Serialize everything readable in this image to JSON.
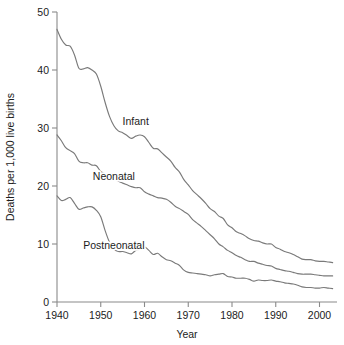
{
  "chart_data": {
    "type": "line",
    "title": "",
    "xlabel": "Year",
    "ylabel": "Deaths per 1,000 live births",
    "xlim": [
      1940,
      2004
    ],
    "ylim": [
      0,
      50
    ],
    "grid": false,
    "legend_position": "inline-labels",
    "xticks": [
      1940,
      1950,
      1960,
      1970,
      1980,
      1990,
      2000
    ],
    "xtick_labels": [
      "1940",
      "1950",
      "1960",
      "1970",
      "1980",
      "1990",
      "2000"
    ],
    "yticks": [
      0,
      10,
      20,
      30,
      40,
      50
    ],
    "ytick_labels": [
      "0",
      "10",
      "20",
      "30",
      "40",
      "50"
    ],
    "line_color": "#7a7a7a",
    "x": [
      1940,
      1941,
      1942,
      1943,
      1944,
      1945,
      1946,
      1947,
      1948,
      1949,
      1950,
      1951,
      1952,
      1953,
      1954,
      1955,
      1956,
      1957,
      1958,
      1959,
      1960,
      1961,
      1962,
      1963,
      1964,
      1965,
      1966,
      1967,
      1968,
      1969,
      1970,
      1971,
      1972,
      1973,
      1974,
      1975,
      1976,
      1977,
      1978,
      1979,
      1980,
      1981,
      1982,
      1983,
      1984,
      1985,
      1986,
      1987,
      1988,
      1989,
      1990,
      1991,
      1992,
      1993,
      1994,
      1995,
      1996,
      1997,
      1998,
      1999,
      2000,
      2001,
      2002,
      2003
    ],
    "series": [
      {
        "name": "Infant",
        "label": "Infant",
        "label_x": 1958,
        "label_y": 30.5,
        "values": [
          47.0,
          45.3,
          44.3,
          44.1,
          42.6,
          40.3,
          40.2,
          40.4,
          40.0,
          39.3,
          37.2,
          34.4,
          32.0,
          30.4,
          29.5,
          29.2,
          28.7,
          28.2,
          28.6,
          28.8,
          28.5,
          27.5,
          26.5,
          26.4,
          25.7,
          25.0,
          24.3,
          23.2,
          22.4,
          21.1,
          20.2,
          19.2,
          18.5,
          17.8,
          17.0,
          16.1,
          15.6,
          14.8,
          14.4,
          13.3,
          12.8,
          12.1,
          11.8,
          11.4,
          10.9,
          10.6,
          10.5,
          10.2,
          10.0,
          10.0,
          9.4,
          9.1,
          8.7,
          8.5,
          8.2,
          7.8,
          7.4,
          7.3,
          7.3,
          7.1,
          7.0,
          7.0,
          6.9,
          6.8
        ]
      },
      {
        "name": "Neonatal",
        "label": "Neonatal",
        "label_x": 1953,
        "label_y": 21.0,
        "values": [
          28.8,
          27.8,
          26.6,
          26.1,
          25.6,
          24.3,
          24.0,
          24.0,
          23.6,
          23.5,
          22.5,
          22.1,
          21.7,
          21.3,
          20.8,
          20.5,
          20.2,
          19.9,
          19.7,
          19.7,
          19.0,
          18.6,
          18.3,
          18.0,
          17.9,
          17.7,
          17.2,
          16.5,
          16.1,
          15.6,
          15.1,
          14.2,
          13.6,
          13.0,
          12.3,
          11.6,
          10.9,
          10.0,
          9.5,
          8.9,
          8.5,
          8.0,
          7.7,
          7.3,
          7.0,
          7.0,
          6.7,
          6.5,
          6.3,
          6.2,
          5.8,
          5.6,
          5.4,
          5.3,
          5.1,
          4.9,
          4.8,
          4.8,
          4.8,
          4.7,
          4.6,
          4.5,
          4.5,
          4.5
        ]
      },
      {
        "name": "Postneonatal",
        "label": "Postneonatal",
        "label_x": 1953,
        "label_y": 9.2,
        "values": [
          18.3,
          17.5,
          17.7,
          18.0,
          17.0,
          16.0,
          16.2,
          16.4,
          16.4,
          15.8,
          14.7,
          12.3,
          10.3,
          9.1,
          8.7,
          8.7,
          8.5,
          8.3,
          8.9,
          9.1,
          9.5,
          8.9,
          8.2,
          8.4,
          7.8,
          7.3,
          7.1,
          6.7,
          6.3,
          5.5,
          5.1,
          5.0,
          4.9,
          4.8,
          4.7,
          4.5,
          4.7,
          4.8,
          4.9,
          4.4,
          4.3,
          4.1,
          4.1,
          4.1,
          3.9,
          3.6,
          3.8,
          3.7,
          3.7,
          3.8,
          3.6,
          3.5,
          3.3,
          3.2,
          3.1,
          2.9,
          2.6,
          2.5,
          2.5,
          2.4,
          2.4,
          2.5,
          2.4,
          2.3
        ]
      }
    ]
  }
}
